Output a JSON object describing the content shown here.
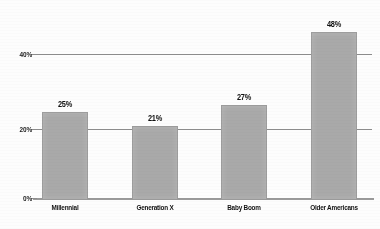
{
  "chart_data": {
    "type": "bar",
    "title": "",
    "subtitle": "",
    "xlabel": "",
    "ylabel": "",
    "categories": [
      "Millennial",
      "Generation X",
      "Baby Boom",
      "Older Americans"
    ],
    "values": [
      25,
      21,
      27,
      48
    ],
    "value_labels": [
      "25%",
      "21%",
      "27%",
      "48%"
    ],
    "ylim": [
      0,
      55
    ],
    "yticks": [
      0,
      20,
      40
    ],
    "ytick_labels": [
      "0%",
      "20%",
      "40%"
    ],
    "grid": true,
    "legend": "none",
    "bar_color": "#a9a9a9",
    "gridline_color": "#8e8e8e",
    "text_color": "#111111",
    "background_color": "#fdfdfd"
  },
  "axis": {
    "y": {
      "tick_40": "40%",
      "tick_20": "20%",
      "tick_0": "0%"
    }
  },
  "bars": [
    {
      "label": "Millennial",
      "value_label": "25%"
    },
    {
      "label": "Generation X",
      "value_label": "21%"
    },
    {
      "label": "Baby Boom",
      "value_label": "27%"
    },
    {
      "label": "Older Americans",
      "value_label": "48%"
    }
  ]
}
